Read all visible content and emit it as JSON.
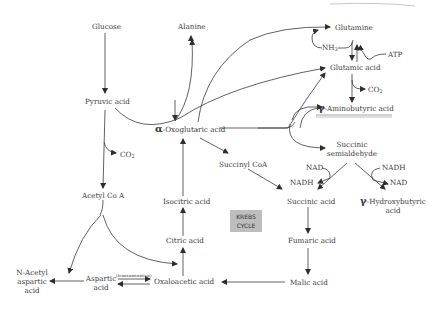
{
  "diagram": {
    "title": "",
    "nodes": {
      "glucose": "Glucose",
      "alanine": "Alanine",
      "pyruvic": "Pyruvic acid",
      "co2_left": "CO",
      "co2_left_sub": "2",
      "acetyl_coa": "Acetyl Co A",
      "oxoglutaric_greek": "α",
      "oxoglutaric": "-Oxoglutaric acid",
      "glutamine": "Glutamine",
      "nh3": "NH",
      "nh3_sub": "3",
      "atp": "ATP",
      "glutamic": "Glutamic acid",
      "co2_right": "CO",
      "co2_right_sub": "2",
      "gaba_greek": "γ",
      "gaba": "-Aminobutyric acid",
      "succinic_semi_1": "Succinic",
      "succinic_semi_2": "semialdehyde",
      "succinyl_coa": "Succinyl CoA",
      "nad_1": "NAD",
      "nadh_1": "NADH",
      "nadh_2": "NADH",
      "nad_2": "NAD",
      "succinic": "Succinic acid",
      "ghb_greek": "γ",
      "ghb_1": "-Hydroxybutyric",
      "ghb_2": "acid",
      "isocitric": "Isocitric acid",
      "citric": "Citric acid",
      "krebs_1": "KREBS",
      "krebs_2": "CYCLE",
      "fumaric": "Fumaric acid",
      "n_acetyl_1": "N-Acetyl",
      "n_acetyl_2": "aspartic",
      "n_acetyl_3": "acid",
      "aspartic_1": "Aspartic",
      "aspartic_2": "acid",
      "transamination": "(transamination)",
      "oxaloacetic": "Oxaloacetic acid",
      "malic": "Malic acid"
    },
    "colors": {
      "line": "#3a3a3a",
      "krebs_box": "#bdbdbd",
      "background": "#ffffff"
    }
  }
}
